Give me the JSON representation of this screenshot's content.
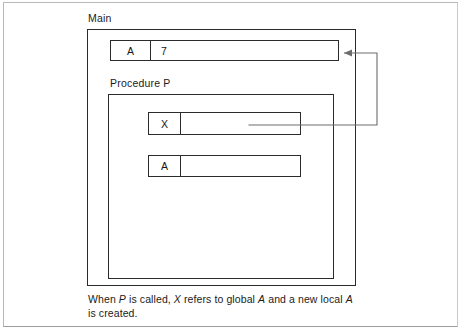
{
  "page": {
    "background": "#ffffff",
    "ink": "#2b2b2b"
  },
  "diagram": {
    "type": "scope-nesting-diagram",
    "outer_scope": {
      "label": "Main",
      "variables": [
        {
          "name": "A",
          "value": "7",
          "kind": "global"
        }
      ]
    },
    "inner_scope": {
      "label": "Procedure P",
      "variables": [
        {
          "name": "X",
          "value": "",
          "kind": "pointer-to-global-A"
        },
        {
          "name": "A",
          "value": "",
          "kind": "local"
        }
      ]
    },
    "pointer": {
      "from": "X",
      "to": "A",
      "arrowhead": "left",
      "stroke": "#6d6d6d"
    }
  },
  "caption": {
    "line1_part1": "When ",
    "line1_em1": "P",
    "line1_part2": " is called, ",
    "line1_em2": "X",
    "line1_part3": " refers to global ",
    "line1_em3": "A",
    "line1_part4": " and a new local ",
    "line1_em4": "A",
    "line2": "is created."
  }
}
